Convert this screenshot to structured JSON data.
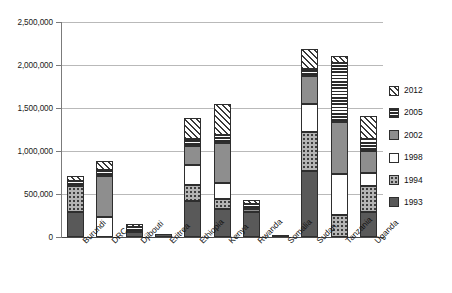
{
  "chart_data": {
    "type": "bar",
    "subtype": "stacked-vertical",
    "title": "",
    "xlabel": "",
    "ylabel": "",
    "ylim": [
      0,
      2500000
    ],
    "ytick_values": [
      0,
      500000,
      1000000,
      1500000,
      2000000,
      2500000
    ],
    "ytick_labels": [
      "0",
      "500,000",
      "1,000,000",
      "1,500,000",
      "2,000,000",
      "2,500,000"
    ],
    "grid": true,
    "grid_axis": "y",
    "legend_position": "right",
    "categories": [
      "Burundi",
      "DRC",
      "Djibouti",
      "Eritrea",
      "Ethiopia",
      "Kenya",
      "Rwanda",
      "Somalia",
      "Sudan",
      "Tanzania",
      "Uganda"
    ],
    "series": [
      {
        "name": "1993",
        "pattern": "solid-dark-gray",
        "color": "#595959",
        "values": [
          290000,
          0,
          55000,
          30000,
          420000,
          330000,
          290000,
          25000,
          770000,
          0,
          290000
        ]
      },
      {
        "name": "1994",
        "pattern": "dotted",
        "color": "#b4b4b4",
        "values": [
          300000,
          0,
          0,
          0,
          180000,
          110000,
          0,
          0,
          450000,
          255000,
          300000
        ]
      },
      {
        "name": "1998",
        "pattern": "white",
        "color": "#ffffff",
        "values": [
          0,
          230000,
          0,
          0,
          235000,
          190000,
          0,
          0,
          330000,
          480000,
          155000
        ]
      },
      {
        "name": "2002",
        "pattern": "solid-mid-gray",
        "color": "#8e8e8e",
        "values": [
          0,
          475000,
          0,
          0,
          225000,
          460000,
          35000,
          0,
          320000,
          600000,
          260000
        ]
      },
      {
        "name": "2005",
        "pattern": "horizontal-stripes",
        "color": "#2b2b2b",
        "values": [
          60000,
          80000,
          60000,
          0,
          75000,
          100000,
          55000,
          0,
          80000,
          690000,
          130000
        ]
      },
      {
        "name": "2012",
        "pattern": "diagonal-hatch",
        "color": "#3a3a3a",
        "values": [
          55000,
          100000,
          35000,
          0,
          250000,
          355000,
          50000,
          0,
          240000,
          80000,
          270000
        ]
      }
    ],
    "totals": [
      705000,
      885000,
      150000,
      30000,
      1385000,
      1545000,
      430000,
      25000,
      2190000,
      2105000,
      1405000
    ]
  },
  "legend": {
    "items": [
      {
        "label": "2012"
      },
      {
        "label": "2005"
      },
      {
        "label": "2002"
      },
      {
        "label": "1998"
      },
      {
        "label": "1994"
      },
      {
        "label": "1993"
      }
    ]
  }
}
